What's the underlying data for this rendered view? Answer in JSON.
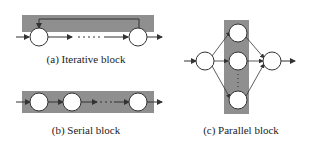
{
  "diagrams": {
    "iterative": {
      "caption": "(a) Iterative block"
    },
    "serial": {
      "caption": "(b) Serial block"
    },
    "parallel": {
      "caption": "(c) Parallel block"
    }
  },
  "colors": {
    "block_fill": "#8f8f8f",
    "node_fill": "#ffffff",
    "line": "#333333"
  }
}
